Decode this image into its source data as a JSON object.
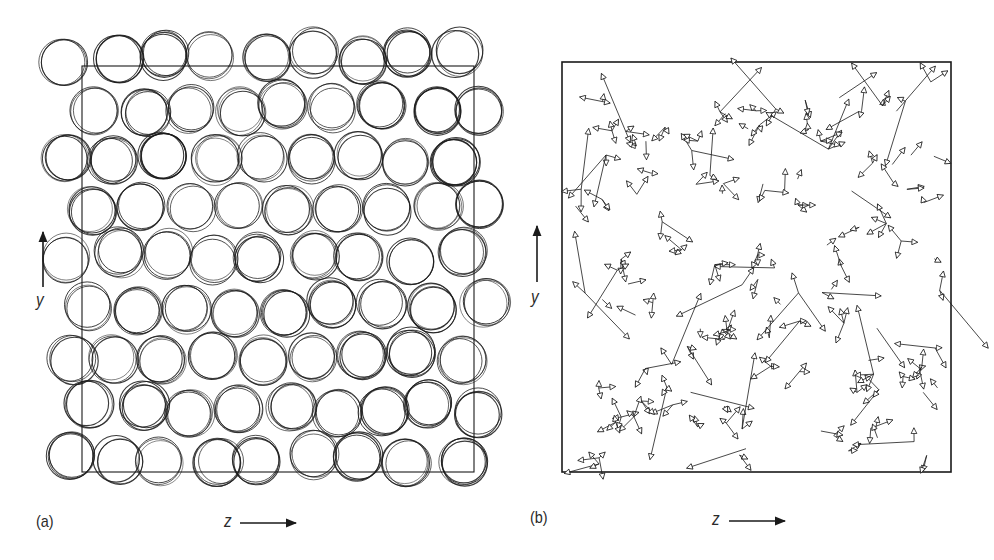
{
  "figure": {
    "panels": [
      {
        "id": "a",
        "label": "(a)",
        "content": "overlaid circles (particle positions over several time steps)",
        "box": {
          "x": 82,
          "y": 66,
          "w": 392,
          "h": 406
        },
        "x_axis_label": "z",
        "y_axis_label": "y",
        "circle_radius": 23,
        "grid": {
          "cols": 9,
          "rows": 9
        },
        "overlay_count": 3
      },
      {
        "id": "b",
        "label": "(b)",
        "content": "displacement vectors drawn as arrows with open triangular heads",
        "box": {
          "x": 562,
          "y": 62,
          "w": 389,
          "h": 410
        },
        "x_axis_label": "z",
        "y_axis_label": "y",
        "cluster_count": 120
      }
    ],
    "colors": {
      "line": "#1a1a1a",
      "background": "#ffffff"
    }
  },
  "labels": {
    "panel_a": "(a)",
    "panel_b": "(b)",
    "a_x": "z",
    "a_y": "y",
    "b_x": "z",
    "b_y": "y"
  }
}
